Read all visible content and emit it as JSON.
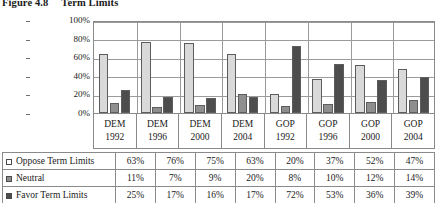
{
  "figure": {
    "number": "Figure 4.8",
    "title": "Term Limits"
  },
  "chart_data": {
    "type": "bar",
    "title": "Term Limits",
    "xlabel": "",
    "ylabel": "",
    "ylim": [
      0,
      100
    ],
    "ytick_labels": [
      "100%",
      "80%",
      "60%",
      "40%",
      "20%",
      "0%"
    ],
    "ytick_values": [
      100,
      80,
      60,
      40,
      20,
      0
    ],
    "grid": true,
    "legend_position": "table-left",
    "categories": [
      {
        "party": "DEM",
        "year": "1992"
      },
      {
        "party": "DEM",
        "year": "1996"
      },
      {
        "party": "DEM",
        "year": "2000"
      },
      {
        "party": "DEM",
        "year": "2004"
      },
      {
        "party": "GOP",
        "year": "1992"
      },
      {
        "party": "GOP",
        "year": "1996"
      },
      {
        "party": "GOP",
        "year": "2000"
      },
      {
        "party": "GOP",
        "year": "2004"
      }
    ],
    "series": [
      {
        "name": "Oppose Term Limits",
        "key": "oppose",
        "color": "#d9d9d9",
        "values": [
          63,
          76,
          75,
          63,
          20,
          37,
          52,
          47
        ],
        "labels": [
          "63%",
          "76%",
          "75%",
          "63%",
          "20%",
          "37%",
          "52%",
          "47%"
        ]
      },
      {
        "name": "Neutral",
        "key": "neutral",
        "color": "#8f8f8f",
        "values": [
          11,
          7,
          9,
          20,
          8,
          10,
          12,
          14
        ],
        "labels": [
          "11%",
          "7%",
          "9%",
          "20%",
          "8%",
          "10%",
          "12%",
          "14%"
        ]
      },
      {
        "name": "Favor Term Limits",
        "key": "favor",
        "color": "#4d4d4d",
        "values": [
          25,
          17,
          16,
          17,
          72,
          53,
          36,
          39
        ],
        "labels": [
          "25%",
          "17%",
          "16%",
          "17%",
          "72%",
          "53%",
          "36%",
          "39%"
        ]
      }
    ]
  }
}
